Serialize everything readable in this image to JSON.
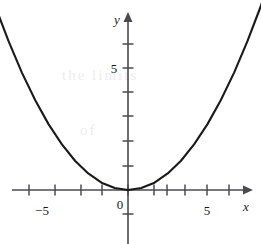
{
  "figure": {
    "name": "parabola-graph",
    "width": 261,
    "height": 244,
    "background_color": "#ffffff",
    "ink_color": "#1a1a1a",
    "axis_color": "#4a4a52",
    "watermark_color": "#ededeb"
  },
  "labels": {
    "y_axis": "y",
    "x_axis": "x",
    "origin": "0",
    "x_negative_five": "−5",
    "x_positive_five": "5",
    "y_five": "5"
  },
  "watermark": {
    "line1": "the limits",
    "line2": "of"
  },
  "chart_data": {
    "type": "line",
    "title": "",
    "xlabel": "x",
    "ylabel": "y",
    "grid": false,
    "legend": null,
    "xlim": [
      -6.4,
      6.4
    ],
    "ylim": [
      -1.2,
      7.2
    ],
    "origin_px": [
      128,
      190
    ],
    "x_unit_px": 26.5,
    "y_unit_px": 24.4,
    "x_ticks": [
      -6,
      -5,
      -4,
      -3,
      -2,
      -1,
      1,
      2,
      3,
      4,
      5,
      6
    ],
    "x_tick_labels": [
      {
        "value": -5,
        "label": "−5"
      },
      {
        "value": 5,
        "label": "5"
      }
    ],
    "y_ticks": [
      -1,
      1,
      2,
      3,
      4,
      5,
      6,
      7
    ],
    "y_tick_labels": [
      {
        "value": 5,
        "label": "5"
      }
    ],
    "series": [
      {
        "name": "parabola",
        "equation": "y = 0.3 x^2",
        "color": "#1a1a1a",
        "x": [
          -5.5,
          -5.0,
          -4.5,
          -4.0,
          -3.5,
          -3.0,
          -2.5,
          -2.0,
          -1.5,
          -1.0,
          -0.5,
          0.0,
          0.5,
          1.0,
          1.5,
          2.0,
          2.5,
          3.0,
          3.5,
          4.0,
          4.5,
          5.0,
          5.5
        ],
        "y": [
          9.08,
          7.5,
          6.08,
          4.8,
          3.68,
          2.7,
          1.88,
          1.2,
          0.68,
          0.3,
          0.08,
          0.0,
          0.08,
          0.3,
          0.68,
          1.2,
          1.88,
          2.7,
          3.68,
          4.8,
          6.08,
          7.5,
          9.08
        ]
      }
    ],
    "vertex": [
      0,
      0
    ]
  }
}
